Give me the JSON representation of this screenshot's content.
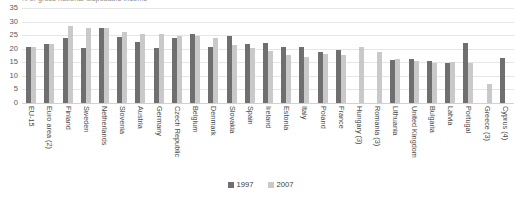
{
  "chart_data": {
    "type": "bar",
    "title": "% of gross national disposable income",
    "xlabel": "",
    "ylabel": "",
    "ylim": [
      0,
      35
    ],
    "yticks": [
      0,
      5,
      10,
      15,
      20,
      25,
      30,
      35
    ],
    "grid": true,
    "legend_position": "bottom",
    "categories": [
      "EU-15",
      "Euro area (2)",
      "Finland",
      "Sweden",
      "Netherlands",
      "Slovenia",
      "Austria",
      "Germany",
      "Czech Republic",
      "Belgium",
      "Denmark",
      "Slovakia",
      "Spain",
      "Ireland",
      "Estonia",
      "Italy",
      "Poland",
      "France",
      "Hungary (3)",
      "Romania (3)",
      "Lithuania",
      "United Kingdom",
      "Bulgaria",
      "Latvia",
      "Portugal",
      "Greece (3)",
      "Cyprus (4)"
    ],
    "series": [
      {
        "name": "1997",
        "color": "#6f6f6f",
        "values": [
          20.6,
          21.6,
          24.0,
          20.4,
          27.8,
          24.2,
          22.4,
          20.3,
          24.0,
          25.5,
          20.8,
          24.7,
          21.6,
          22.0,
          20.5,
          20.8,
          18.8,
          19.4,
          null,
          null,
          16.0,
          16.1,
          15.4,
          14.6,
          22.0,
          null,
          16.5
        ]
      },
      {
        "name": "2007",
        "color": "#c9c9c9",
        "values": [
          20.8,
          21.8,
          28.5,
          27.7,
          27.5,
          26.0,
          25.6,
          25.3,
          24.6,
          24.7,
          24.0,
          21.3,
          20.4,
          19.2,
          17.6,
          16.9,
          18.0,
          17.6,
          20.6,
          18.9,
          16.4,
          15.5,
          14.8,
          15.2,
          14.6,
          7.0,
          null
        ]
      }
    ]
  },
  "legend": {
    "items": [
      {
        "label": "1997",
        "color": "#6f6f6f"
      },
      {
        "label": "2007",
        "color": "#c9c9c9"
      }
    ]
  }
}
